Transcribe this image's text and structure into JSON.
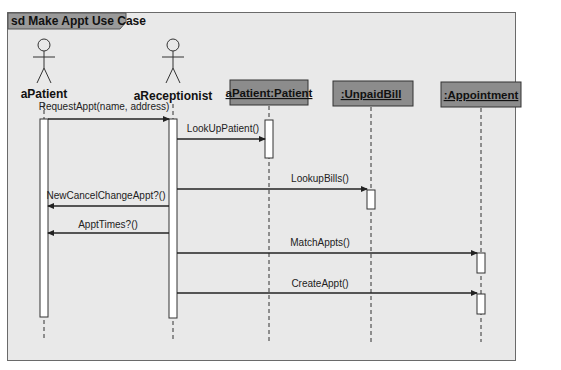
{
  "frame": {
    "label": "sd Make Appt Use Case"
  },
  "colors": {
    "background": "#e9e9e9",
    "object_box": "#8c8c8c",
    "tab": "#9a9a9a",
    "line": "#333333",
    "activation": "#ffffff"
  },
  "lifelines": [
    {
      "id": "aPatient",
      "label": "aPatient",
      "kind": "actor",
      "x": 44
    },
    {
      "id": "aReceptionist",
      "label": "aReceptionist",
      "kind": "actor",
      "x": 173
    },
    {
      "id": "patient",
      "label": "aPatient:Patient",
      "kind": "object",
      "x": 269
    },
    {
      "id": "unpaidbill",
      "label": ":UnpaidBill",
      "kind": "object",
      "x": 371
    },
    {
      "id": "appointment",
      "label": ":Appointment",
      "kind": "object",
      "x": 481
    }
  ],
  "messages": [
    {
      "label": "RequestAppt(name, address)",
      "from": "aPatient",
      "to": "aReceptionist",
      "y": 119
    },
    {
      "label": "LookUpPatient()",
      "from": "aReceptionist",
      "to": "patient",
      "y": 139
    },
    {
      "label": "LookupBills()",
      "from": "aReceptionist",
      "to": "unpaidbill",
      "y": 189
    },
    {
      "label": "NewCancelChangeAppt?()",
      "from": "aReceptionist",
      "to": "aPatient",
      "y": 206
    },
    {
      "label": "ApptTimes?()",
      "from": "aReceptionist",
      "to": "aPatient",
      "y": 233
    },
    {
      "label": "MatchAppts()",
      "from": "aReceptionist",
      "to": "appointment",
      "y": 253
    },
    {
      "label": "CreateAppt()",
      "from": "aReceptionist",
      "to": "appointment",
      "y": 293
    }
  ]
}
